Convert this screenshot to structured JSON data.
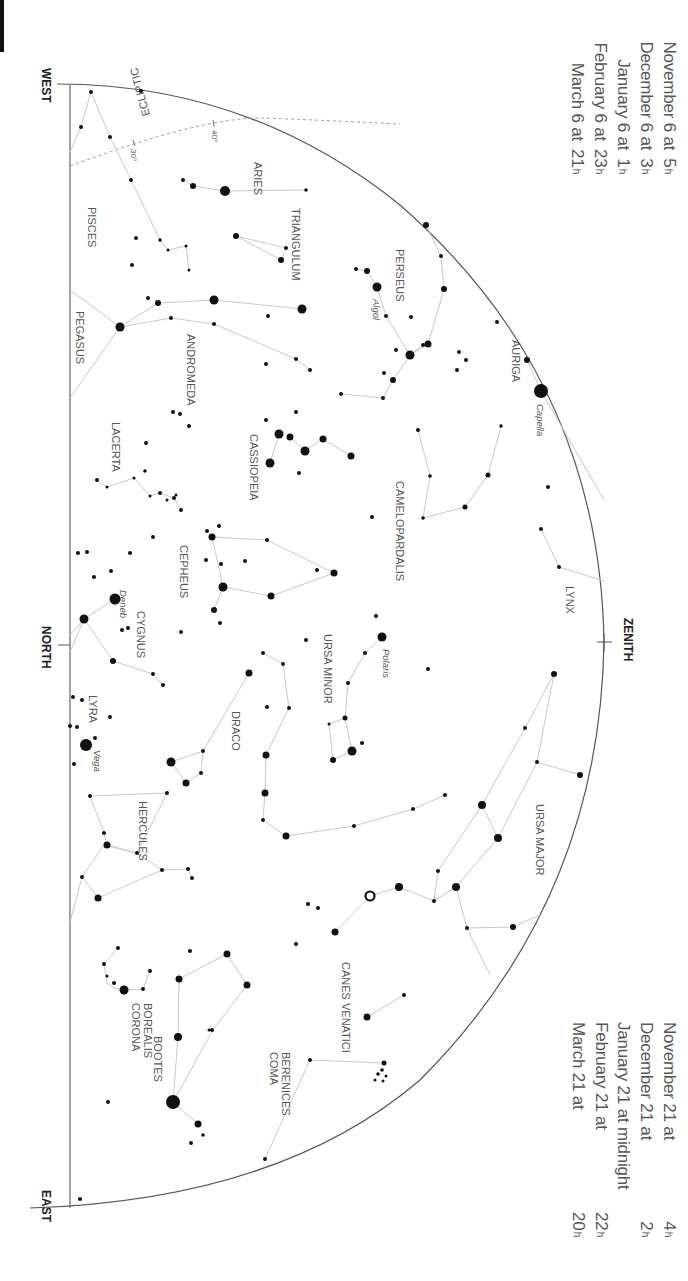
{
  "title_marks": {
    "west": "WEST",
    "north": "NORTH",
    "east": "EAST",
    "zenith": "ZENITH"
  },
  "colors": {
    "line": "#c8c8c8",
    "star": "#111111",
    "horizon": "#555555",
    "label": "#555555",
    "ecliptic": "#9a9a9a",
    "text": "#555555"
  },
  "dates_top": [
    {
      "date": "November 6 at",
      "hour": "5",
      "unit": "h"
    },
    {
      "date": "December 6 at",
      "hour": "3",
      "unit": "h"
    },
    {
      "date": "January 6 at",
      "hour": "1",
      "unit": "h"
    },
    {
      "date": "February 6 at",
      "hour": "23",
      "unit": "h"
    },
    {
      "date": "March 6 at",
      "hour": "21",
      "unit": "h"
    }
  ],
  "dates_bottom": [
    {
      "date": "November 21 at",
      "hour": "4",
      "unit": "h"
    },
    {
      "date": "December 21 at",
      "hour": "2",
      "unit": "h"
    },
    {
      "date": "January 21 at midnight",
      "hour": "",
      "unit": ""
    },
    {
      "date": "February 21 at",
      "hour": "22",
      "unit": "h"
    },
    {
      "date": "March 21 at",
      "hour": "20",
      "unit": "h"
    }
  ],
  "ecliptic": {
    "label": "ECLIPTIC",
    "ticks": [
      {
        "label": "30°"
      },
      {
        "label": "40°"
      }
    ]
  },
  "constellations": [
    {
      "name": "PISCES"
    },
    {
      "name": "ARIES"
    },
    {
      "name": "TRIANGULUM"
    },
    {
      "name": "PERSEUS"
    },
    {
      "name": "AURIGA"
    },
    {
      "name": "PEGASUS"
    },
    {
      "name": "ANDROMEDA"
    },
    {
      "name": "CASSIOPEIA"
    },
    {
      "name": "CAMELOPARDALIS"
    },
    {
      "name": "LACERTA"
    },
    {
      "name": "CEPHEUS"
    },
    {
      "name": "LYNX"
    },
    {
      "name": "CYGNUS"
    },
    {
      "name": "URSA MINOR"
    },
    {
      "name": "LYRA"
    },
    {
      "name": "DRACO"
    },
    {
      "name": "URSA MAJOR"
    },
    {
      "name": "HERCULES"
    },
    {
      "name": "CANES VENATICI"
    },
    {
      "name": "CORONA BOREALIS"
    },
    {
      "name": "BOOTES"
    },
    {
      "name": "COMA BERENICES"
    }
  ],
  "named_stars": [
    {
      "name": "Algol"
    },
    {
      "name": "Capella"
    },
    {
      "name": "Deneb"
    },
    {
      "name": "Polaris"
    },
    {
      "name": "Vega"
    }
  ]
}
